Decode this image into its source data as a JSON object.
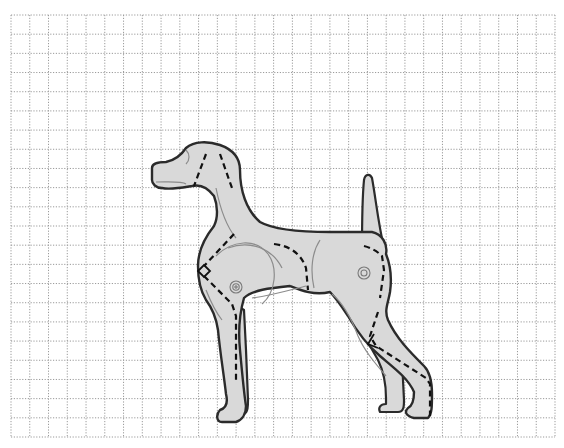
{
  "diagram": {
    "grid": {
      "x0": 11,
      "y0": 15,
      "x1": 555,
      "y1": 437,
      "cols": 29,
      "rows": 22,
      "line_color": "#9a9a9a",
      "dash": "1.2 1.6"
    },
    "colors": {
      "background": "#ffffff",
      "body_fill": "#d9d9d9",
      "outline": "#2b2b2b",
      "inner_line": "#8c8c8c",
      "cut_line": "#111111"
    },
    "markers": [
      {
        "name": "shoulder-joint-marker",
        "cx": 236,
        "cy": 287
      },
      {
        "name": "hip-joint-marker",
        "cx": 364,
        "cy": 273
      }
    ]
  }
}
